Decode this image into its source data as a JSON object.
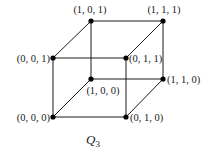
{
  "diagram": {
    "type": "hypercube-graph",
    "title": "Q",
    "title_subscript": "3",
    "vertices": [
      {
        "id": "000",
        "label": "(0, 0, 0)"
      },
      {
        "id": "001",
        "label": "(0, 0, 1)"
      },
      {
        "id": "010",
        "label": "(0, 1, 0)"
      },
      {
        "id": "011",
        "label": "(0, 1, 1)"
      },
      {
        "id": "100",
        "label": "(1, 0, 0)"
      },
      {
        "id": "101",
        "label": "(1, 0, 1)"
      },
      {
        "id": "110",
        "label": "(1, 1, 0)"
      },
      {
        "id": "111",
        "label": "(1, 1, 1)"
      }
    ],
    "edges": [
      [
        "000",
        "001"
      ],
      [
        "000",
        "010"
      ],
      [
        "000",
        "100"
      ],
      [
        "001",
        "011"
      ],
      [
        "001",
        "101"
      ],
      [
        "010",
        "011"
      ],
      [
        "010",
        "110"
      ],
      [
        "011",
        "111"
      ],
      [
        "100",
        "101"
      ],
      [
        "100",
        "110"
      ],
      [
        "101",
        "111"
      ],
      [
        "110",
        "111"
      ]
    ],
    "colors": {
      "line": "#1a1a1a",
      "vertex": "#000000",
      "background": "#ffffff"
    }
  }
}
